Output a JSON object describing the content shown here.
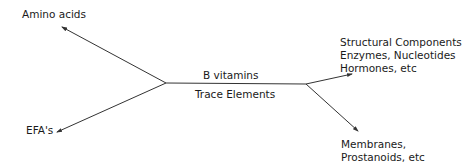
{
  "diagram": {
    "inputs": [
      {
        "label": "Amino acids"
      },
      {
        "label": "EFA's"
      }
    ],
    "center": {
      "above": "B vitamins",
      "below": "Trace Elements"
    },
    "outputs": [
      {
        "lines": [
          "Structural Components",
          "Enzymes, Nucleotides",
          "Hormones, etc"
        ]
      },
      {
        "lines": [
          "Membranes,",
          "Prostanoids, etc"
        ]
      }
    ],
    "colors": {
      "line": "#333333",
      "text": "#1a1a1a",
      "background": "#ffffff"
    }
  }
}
